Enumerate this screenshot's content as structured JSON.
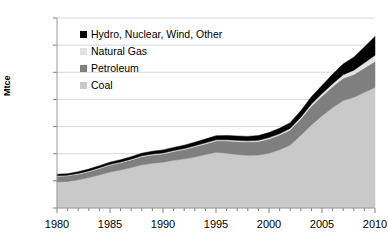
{
  "chart_data": {
    "type": "area",
    "stacked": true,
    "title": "",
    "xlabel": "",
    "ylabel": "Mtce",
    "xlim": [
      1980,
      2010
    ],
    "ylim": [
      0,
      3500
    ],
    "ytick_step": 500,
    "yticks": [
      "0",
      "500",
      "1000",
      "1500",
      "2000",
      "2500",
      "3000",
      "3500"
    ],
    "xticks": [
      "1980",
      "1985",
      "1990",
      "1995",
      "2000",
      "2005",
      "2010"
    ],
    "x_minor_tick_step": 1,
    "grid": "horizontal",
    "legend_position": "upper-left-inside",
    "x": [
      1980,
      1981,
      1982,
      1983,
      1984,
      1985,
      1986,
      1987,
      1988,
      1989,
      1990,
      1991,
      1992,
      1993,
      1994,
      1995,
      1996,
      1997,
      1998,
      1999,
      2000,
      2001,
      2002,
      2003,
      2004,
      2005,
      2006,
      2007,
      2008,
      2009,
      2010
    ],
    "series": [
      {
        "name": "Coal",
        "color": "#c9c9c9",
        "values": [
          480,
          490,
          520,
          560,
          610,
          665,
          700,
          745,
          795,
          825,
          845,
          880,
          905,
          940,
          985,
          1025,
          1010,
          985,
          970,
          975,
          1010,
          1075,
          1160,
          1340,
          1530,
          1700,
          1850,
          1980,
          2040,
          2130,
          2220
        ]
      },
      {
        "name": "Petroleum",
        "color": "#7f7f7f",
        "values": [
          100,
          102,
          104,
          110,
          118,
          125,
          132,
          140,
          150,
          152,
          152,
          160,
          172,
          188,
          196,
          210,
          225,
          240,
          245,
          250,
          262,
          268,
          278,
          300,
          345,
          360,
          385,
          410,
          420,
          450,
          480
        ]
      },
      {
        "name": "Natural Gas",
        "color": "#e3e3e3",
        "values": [
          12,
          12,
          13,
          13,
          14,
          14,
          15,
          15,
          16,
          16,
          17,
          17,
          18,
          18,
          19,
          20,
          21,
          22,
          22,
          23,
          25,
          27,
          29,
          33,
          40,
          48,
          56,
          66,
          78,
          95,
          115
        ]
      },
      {
        "name": "Hydro, Nuclear, Wind, Other",
        "color": "#000000",
        "values": [
          28,
          29,
          31,
          34,
          37,
          40,
          42,
          45,
          48,
          52,
          56,
          58,
          62,
          66,
          70,
          75,
          78,
          80,
          82,
          86,
          92,
          98,
          105,
          118,
          133,
          150,
          172,
          198,
          240,
          290,
          345
        ]
      }
    ],
    "series_order_bottom_to_top": [
      "Coal",
      "Petroleum",
      "Natural Gas",
      "Hydro, Nuclear, Wind, Other"
    ],
    "totals": [
      620,
      633,
      668,
      717,
      779,
      844,
      889,
      945,
      1009,
      1045,
      1070,
      1115,
      1157,
      1212,
      1270,
      1330,
      1334,
      1327,
      1319,
      1334,
      1389,
      1468,
      1572,
      1791,
      2048,
      2258,
      2463,
      2654,
      2778,
      2965,
      3160
    ]
  },
  "legend": {
    "items": [
      {
        "label": "Hydro, Nuclear, Wind, Other",
        "color": "#000000"
      },
      {
        "label": "Natural Gas",
        "color": "#e3e3e3"
      },
      {
        "label": "Petroleum",
        "color": "#7f7f7f"
      },
      {
        "label": "Coal",
        "color": "#c9c9c9"
      }
    ]
  },
  "axes": {
    "y_title": "Mtce"
  }
}
